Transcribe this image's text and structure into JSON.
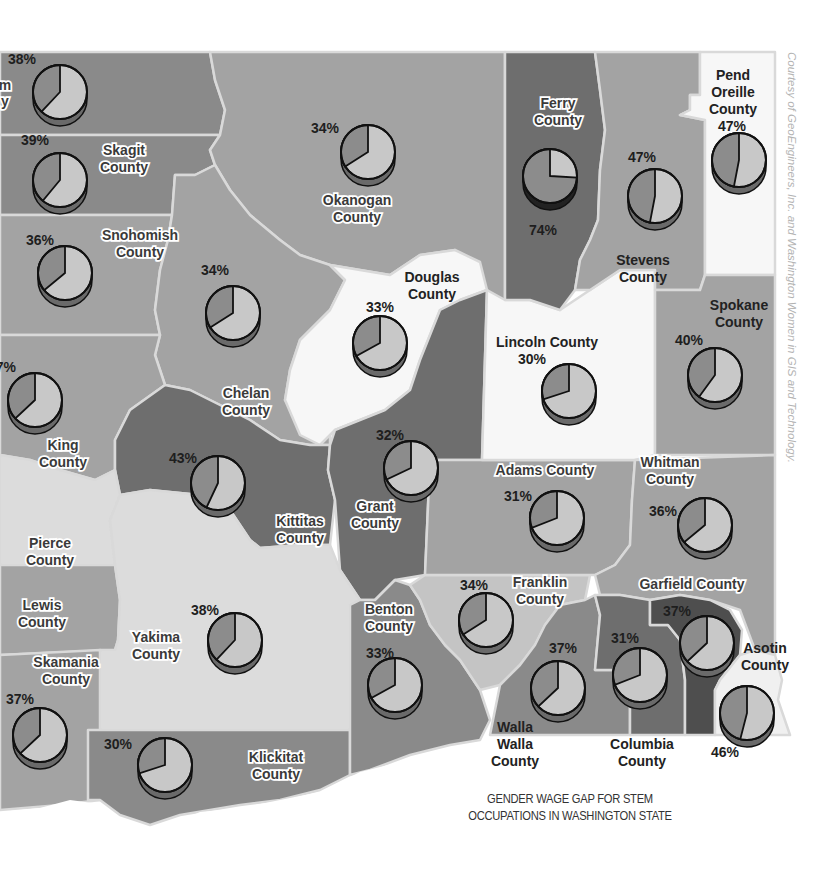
{
  "title": {
    "line1": "GENDER WAGE GAP FOR STEM",
    "line2": "OCCUPATIONS IN WASHINGTON STATE"
  },
  "credit": "Courtesy of GeoEngineers, Inc. and Washington Women in GIS and Technology.",
  "colors": {
    "dark": "#6e6e6e",
    "medium_dark": "#8a8a8a",
    "medium": "#a3a3a3",
    "light": "#c4c4c4",
    "very_light": "#dcdcdc",
    "white": "#f7f7f7",
    "darkest": "#4e4e4e",
    "pie_light": "#c8c8c8",
    "pie_dark": "#8c8c8c",
    "border": "#d9d9d9"
  },
  "counties": [
    {
      "name": "Whatcom",
      "label": [
        "m",
        "y"
      ],
      "pct": "38%",
      "value": 38
    },
    {
      "name": "Skagit",
      "label": [
        "Skagit",
        "County"
      ],
      "pct": "39%",
      "value": 39
    },
    {
      "name": "Snohomish",
      "label": [
        "Snohomish",
        "County"
      ],
      "pct": "36%",
      "value": 36
    },
    {
      "name": "King",
      "label": [
        "King",
        "County"
      ],
      "pct": "37%",
      "value": 37
    },
    {
      "name": "Pierce",
      "label": [
        "Pierce",
        "County"
      ],
      "pct": "",
      "value": null
    },
    {
      "name": "Lewis",
      "label": [
        "Lewis",
        "County"
      ],
      "pct": "",
      "value": null
    },
    {
      "name": "Skamania",
      "label": [
        "Skamania",
        "County"
      ],
      "pct": "37%",
      "value": 37
    },
    {
      "name": "Okanogan",
      "label": [
        "Okanogan",
        "County"
      ],
      "pct": "34%",
      "value": 34
    },
    {
      "name": "Chelan",
      "label": [
        "Chelan",
        "County"
      ],
      "pct": "34%",
      "value": 34
    },
    {
      "name": "Douglas",
      "label": [
        "Douglas",
        "County"
      ],
      "pct": "33%",
      "value": 33
    },
    {
      "name": "Kittitas",
      "label": [
        "Kittitas",
        "County"
      ],
      "pct": "43%",
      "value": 43
    },
    {
      "name": "Grant",
      "label": [
        "Grant",
        "County"
      ],
      "pct": "32%",
      "value": 32
    },
    {
      "name": "Yakima",
      "label": [
        "Yakima",
        "County"
      ],
      "pct": "38%",
      "value": 38
    },
    {
      "name": "Klickitat",
      "label": [
        "Klickitat",
        "County"
      ],
      "pct": "30%",
      "value": 30
    },
    {
      "name": "Benton",
      "label": [
        "Benton",
        "County"
      ],
      "pct": "33%",
      "value": 33
    },
    {
      "name": "Franklin",
      "label": [
        "Franklin",
        "County"
      ],
      "pct": "34%",
      "value": 34
    },
    {
      "name": "Walla Walla",
      "label": [
        "Walla",
        "Walla",
        "County"
      ],
      "pct": "37%",
      "value": 37
    },
    {
      "name": "Columbia",
      "label": [
        "Columbia",
        "County"
      ],
      "pct": "31%",
      "value": 31
    },
    {
      "name": "Garfield",
      "label": [
        "Garfield County"
      ],
      "pct": "37%",
      "value": 37
    },
    {
      "name": "Asotin",
      "label": [
        "Asotin",
        "County"
      ],
      "pct": "46%",
      "value": 46
    },
    {
      "name": "Whitman",
      "label": [
        "Whitman",
        "County"
      ],
      "pct": "36%",
      "value": 36
    },
    {
      "name": "Adams",
      "label": [
        "Adams County"
      ],
      "pct": "31%",
      "value": 31
    },
    {
      "name": "Lincoln",
      "label": [
        "Lincoln County"
      ],
      "pct": "30%",
      "value": 30
    },
    {
      "name": "Spokane",
      "label": [
        "Spokane",
        "County"
      ],
      "pct": "40%",
      "value": 40
    },
    {
      "name": "Ferry",
      "label": [
        "Ferry",
        "County"
      ],
      "pct": "74%",
      "value": 74
    },
    {
      "name": "Stevens",
      "label": [
        "Stevens",
        "County"
      ],
      "pct": "47%",
      "value": 47
    },
    {
      "name": "Pend Oreille",
      "label": [
        "Pend",
        "Oreille",
        "County"
      ],
      "pct": "47%",
      "value": 47
    }
  ],
  "chart_data": {
    "type": "pie",
    "title": "Gender Wage Gap for STEM Occupations in Washington State",
    "categories": [
      "Whatcom",
      "Skagit",
      "Snohomish",
      "King",
      "Skamania",
      "Okanogan",
      "Chelan",
      "Douglas",
      "Kittitas",
      "Grant",
      "Yakima",
      "Klickitat",
      "Benton",
      "Franklin",
      "Walla Walla",
      "Columbia",
      "Garfield",
      "Asotin",
      "Whitman",
      "Adams",
      "Lincoln",
      "Spokane",
      "Ferry",
      "Stevens",
      "Pend Oreille"
    ],
    "values": [
      38,
      39,
      36,
      37,
      37,
      34,
      34,
      33,
      43,
      32,
      38,
      30,
      33,
      34,
      37,
      31,
      37,
      46,
      36,
      31,
      30,
      40,
      74,
      47,
      47
    ],
    "unit": "%"
  }
}
